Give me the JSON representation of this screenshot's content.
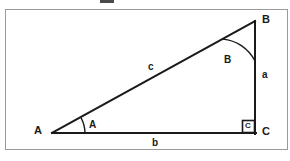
{
  "figure": {
    "kind": "right-triangle-diagram",
    "background_color": "#ffffff",
    "stroke_color": "#1a1a1a",
    "frame_color": "#9a9a9a",
    "frame": {
      "x": 5,
      "y": 9,
      "width": 283,
      "height": 141
    },
    "top_artifact": {
      "x": 100,
      "y": 0,
      "width": 14,
      "height": 3,
      "color": "#4a4a4a"
    }
  },
  "triangle": {
    "vertices": {
      "A": {
        "x": 52,
        "y": 133,
        "label": "A",
        "label_x": 34,
        "label_y": 126
      },
      "B": {
        "x": 255,
        "y": 21,
        "label": "B",
        "label_x": 262,
        "label_y": 15
      },
      "C": {
        "x": 255,
        "y": 133,
        "label": "C",
        "label_x": 262,
        "label_y": 126
      }
    },
    "sides": [
      {
        "name": "a",
        "label": "a",
        "from": "B",
        "to": "C",
        "label_x": 262,
        "label_y": 72
      },
      {
        "name": "b",
        "label": "b",
        "from": "A",
        "to": "C",
        "label_x": 152,
        "label_y": 139
      },
      {
        "name": "c",
        "label": "c",
        "from": "A",
        "to": "B",
        "label_x": 148,
        "label_y": 63
      }
    ],
    "angles": [
      {
        "name": "A",
        "label": "A",
        "label_x": 89,
        "label_y": 122,
        "arc_radius": 33
      },
      {
        "name": "B",
        "label": "B",
        "label_x": 224,
        "label_y": 56,
        "arc_radius": 40
      },
      {
        "name": "C",
        "label": "C",
        "is_right_angle": true,
        "marker_label": "C",
        "marker": {
          "x": 242,
          "y": 120,
          "size": 13
        }
      }
    ]
  }
}
